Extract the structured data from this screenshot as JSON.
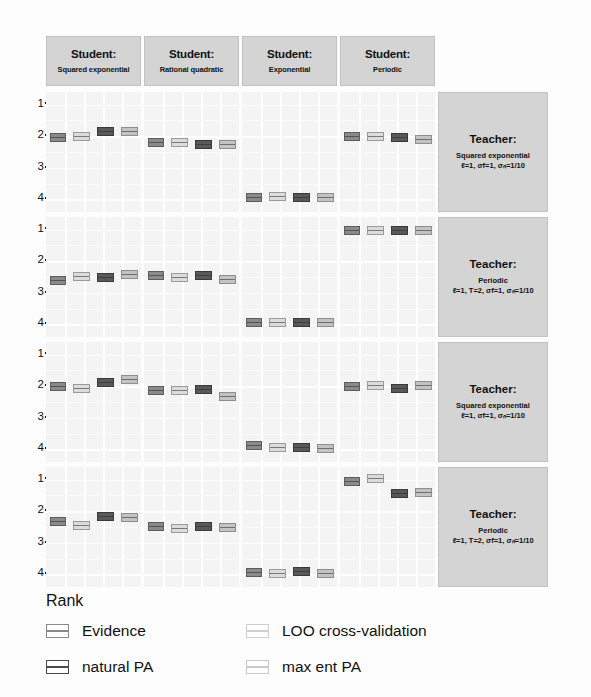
{
  "axis": {
    "ylabel": "Rank",
    "yticks": [
      "1",
      "2",
      "3",
      "4"
    ]
  },
  "columns": [
    {
      "title": "Student:",
      "subtitle": "Squared exponential"
    },
    {
      "title": "Student:",
      "subtitle": "Rational quadratic"
    },
    {
      "title": "Student:",
      "subtitle": "Exponential"
    },
    {
      "title": "Student:",
      "subtitle": "Periodic"
    }
  ],
  "rows": [
    {
      "title": "Teacher:",
      "subtitle": "Squared exponential",
      "params": "ℓ=1, σf=1, σₙ=1/10"
    },
    {
      "title": "Teacher:",
      "subtitle": "Periodic",
      "params": "ℓ=1, T=2, σf=1, σₙ=1/10"
    },
    {
      "title": "Teacher:",
      "subtitle": "Squared exponential",
      "params": "ℓ=1, σf=1, σₙ=1/10"
    },
    {
      "title": "Teacher:",
      "subtitle": "Periodic",
      "params": "ℓ=1, T=2, σf=1, σₙ=1/10"
    }
  ],
  "legend": [
    {
      "key": "evidence",
      "label": "Evidence"
    },
    {
      "key": "loo",
      "label": "LOO cross-validation"
    },
    {
      "key": "natural",
      "label": "natural PA"
    },
    {
      "key": "maxent",
      "label": "max ent PA"
    }
  ],
  "chart_data": {
    "type": "box",
    "title": "",
    "xlabel": "",
    "ylabel": "Rank",
    "ylim": [
      0.6,
      4.4
    ],
    "yticks": [
      1,
      2,
      3,
      4
    ],
    "grid": true,
    "legend_position": "bottom-left",
    "legend_entries": [
      "Evidence",
      "LOO cross-validation",
      "natural PA",
      "max ent PA"
    ],
    "facet_columns": [
      "Squared exponential",
      "Rational quadratic",
      "Exponential",
      "Periodic"
    ],
    "facet_rows": [
      "Squared exponential",
      "Periodic",
      "Squared exponential",
      "Periodic"
    ],
    "methods": [
      "Evidence",
      "LOO cross-validation",
      "natural PA",
      "max ent PA"
    ],
    "panels": [
      {
        "row": 0,
        "col": 0,
        "teacher": "Squared exponential",
        "student": "Squared exponential",
        "boxes": [
          {
            "method": "Evidence",
            "median": 2.05,
            "q1": 1.95,
            "q3": 2.15
          },
          {
            "method": "LOO cross-validation",
            "median": 2.0,
            "q1": 1.9,
            "q3": 2.1
          },
          {
            "method": "natural PA",
            "median": 1.85,
            "q1": 1.75,
            "q3": 1.95
          },
          {
            "method": "max ent PA",
            "median": 1.85,
            "q1": 1.75,
            "q3": 1.95
          }
        ]
      },
      {
        "row": 0,
        "col": 1,
        "teacher": "Squared exponential",
        "student": "Rational quadratic",
        "boxes": [
          {
            "method": "Evidence",
            "median": 2.2,
            "q1": 2.1,
            "q3": 2.3
          },
          {
            "method": "LOO cross-validation",
            "median": 2.2,
            "q1": 2.1,
            "q3": 2.3
          },
          {
            "method": "natural PA",
            "median": 2.25,
            "q1": 2.15,
            "q3": 2.35
          },
          {
            "method": "max ent PA",
            "median": 2.25,
            "q1": 2.15,
            "q3": 2.35
          }
        ]
      },
      {
        "row": 0,
        "col": 2,
        "teacher": "Squared exponential",
        "student": "Exponential",
        "boxes": [
          {
            "method": "Evidence",
            "median": 3.95,
            "q1": 3.88,
            "q3": 4.0
          },
          {
            "method": "LOO cross-validation",
            "median": 3.9,
            "q1": 3.82,
            "q3": 3.98
          },
          {
            "method": "natural PA",
            "median": 3.95,
            "q1": 3.88,
            "q3": 4.0
          },
          {
            "method": "max ent PA",
            "median": 3.95,
            "q1": 3.88,
            "q3": 4.0
          }
        ]
      },
      {
        "row": 0,
        "col": 3,
        "teacher": "Squared exponential",
        "student": "Periodic",
        "boxes": [
          {
            "method": "Evidence",
            "median": 2.0,
            "q1": 1.9,
            "q3": 2.1
          },
          {
            "method": "LOO cross-validation",
            "median": 2.0,
            "q1": 1.9,
            "q3": 2.1
          },
          {
            "method": "natural PA",
            "median": 2.05,
            "q1": 1.95,
            "q3": 2.15
          },
          {
            "method": "max ent PA",
            "median": 2.1,
            "q1": 2.0,
            "q3": 2.2
          }
        ]
      },
      {
        "row": 1,
        "col": 0,
        "teacher": "Periodic",
        "student": "Squared exponential",
        "boxes": [
          {
            "method": "Evidence",
            "median": 2.62,
            "q1": 2.52,
            "q3": 2.72
          },
          {
            "method": "LOO cross-validation",
            "median": 2.48,
            "q1": 2.38,
            "q3": 2.58
          },
          {
            "method": "natural PA",
            "median": 2.52,
            "q1": 2.42,
            "q3": 2.62
          },
          {
            "method": "max ent PA",
            "median": 2.42,
            "q1": 2.32,
            "q3": 2.52
          }
        ]
      },
      {
        "row": 1,
        "col": 1,
        "teacher": "Periodic",
        "student": "Rational quadratic",
        "boxes": [
          {
            "method": "Evidence",
            "median": 2.45,
            "q1": 2.35,
            "q3": 2.55
          },
          {
            "method": "LOO cross-validation",
            "median": 2.52,
            "q1": 2.42,
            "q3": 2.62
          },
          {
            "method": "natural PA",
            "median": 2.45,
            "q1": 2.35,
            "q3": 2.55
          },
          {
            "method": "max ent PA",
            "median": 2.58,
            "q1": 2.48,
            "q3": 2.68
          }
        ]
      },
      {
        "row": 1,
        "col": 2,
        "teacher": "Periodic",
        "student": "Exponential",
        "boxes": [
          {
            "method": "Evidence",
            "median": 3.95,
            "q1": 3.88,
            "q3": 4.0
          },
          {
            "method": "LOO cross-validation",
            "median": 3.95,
            "q1": 3.88,
            "q3": 4.0
          },
          {
            "method": "natural PA",
            "median": 3.95,
            "q1": 3.88,
            "q3": 4.0
          },
          {
            "method": "max ent PA",
            "median": 3.95,
            "q1": 3.88,
            "q3": 4.0
          }
        ]
      },
      {
        "row": 1,
        "col": 3,
        "teacher": "Periodic",
        "student": "Periodic",
        "boxes": [
          {
            "method": "Evidence",
            "median": 1.02,
            "q1": 1.0,
            "q3": 1.08
          },
          {
            "method": "LOO cross-validation",
            "median": 1.02,
            "q1": 1.0,
            "q3": 1.08
          },
          {
            "method": "natural PA",
            "median": 1.02,
            "q1": 1.0,
            "q3": 1.08
          },
          {
            "method": "max ent PA",
            "median": 1.02,
            "q1": 1.0,
            "q3": 1.08
          }
        ]
      },
      {
        "row": 2,
        "col": 0,
        "teacher": "Squared exponential",
        "student": "Squared exponential",
        "boxes": [
          {
            "method": "Evidence",
            "median": 2.02,
            "q1": 1.92,
            "q3": 2.12
          },
          {
            "method": "LOO cross-validation",
            "median": 2.08,
            "q1": 1.98,
            "q3": 2.18
          },
          {
            "method": "natural PA",
            "median": 1.88,
            "q1": 1.78,
            "q3": 1.98
          },
          {
            "method": "max ent PA",
            "median": 1.8,
            "q1": 1.7,
            "q3": 1.9
          }
        ]
      },
      {
        "row": 2,
        "col": 1,
        "teacher": "Squared exponential",
        "student": "Rational quadratic",
        "boxes": [
          {
            "method": "Evidence",
            "median": 2.12,
            "q1": 2.02,
            "q3": 2.22
          },
          {
            "method": "LOO cross-validation",
            "median": 2.12,
            "q1": 2.02,
            "q3": 2.22
          },
          {
            "method": "natural PA",
            "median": 2.1,
            "q1": 2.0,
            "q3": 2.2
          },
          {
            "method": "max ent PA",
            "median": 2.32,
            "q1": 2.22,
            "q3": 2.42
          }
        ]
      },
      {
        "row": 2,
        "col": 2,
        "teacher": "Squared exponential",
        "student": "Exponential",
        "boxes": [
          {
            "method": "Evidence",
            "median": 3.88,
            "q1": 3.8,
            "q3": 3.96
          },
          {
            "method": "LOO cross-validation",
            "median": 3.95,
            "q1": 3.88,
            "q3": 4.0
          },
          {
            "method": "natural PA",
            "median": 3.95,
            "q1": 3.88,
            "q3": 4.0
          },
          {
            "method": "max ent PA",
            "median": 3.98,
            "q1": 3.92,
            "q3": 4.02
          }
        ]
      },
      {
        "row": 2,
        "col": 3,
        "teacher": "Squared exponential",
        "student": "Periodic",
        "boxes": [
          {
            "method": "Evidence",
            "median": 2.02,
            "q1": 1.92,
            "q3": 2.12
          },
          {
            "method": "LOO cross-validation",
            "median": 1.98,
            "q1": 1.88,
            "q3": 2.08
          },
          {
            "method": "natural PA",
            "median": 2.08,
            "q1": 1.98,
            "q3": 2.18
          },
          {
            "method": "max ent PA",
            "median": 1.98,
            "q1": 1.88,
            "q3": 2.08
          }
        ]
      },
      {
        "row": 3,
        "col": 0,
        "teacher": "Periodic",
        "student": "Squared exponential",
        "boxes": [
          {
            "method": "Evidence",
            "median": 2.32,
            "q1": 2.22,
            "q3": 2.42
          },
          {
            "method": "LOO cross-validation",
            "median": 2.45,
            "q1": 2.35,
            "q3": 2.55
          },
          {
            "method": "natural PA",
            "median": 2.18,
            "q1": 2.08,
            "q3": 2.28
          },
          {
            "method": "max ent PA",
            "median": 2.2,
            "q1": 2.1,
            "q3": 2.3
          }
        ]
      },
      {
        "row": 3,
        "col": 1,
        "teacher": "Periodic",
        "student": "Rational quadratic",
        "boxes": [
          {
            "method": "Evidence",
            "median": 2.48,
            "q1": 2.38,
            "q3": 2.58
          },
          {
            "method": "LOO cross-validation",
            "median": 2.55,
            "q1": 2.45,
            "q3": 2.65
          },
          {
            "method": "natural PA",
            "median": 2.48,
            "q1": 2.38,
            "q3": 2.58
          },
          {
            "method": "max ent PA",
            "median": 2.52,
            "q1": 2.42,
            "q3": 2.62
          }
        ]
      },
      {
        "row": 3,
        "col": 2,
        "teacher": "Periodic",
        "student": "Exponential",
        "boxes": [
          {
            "method": "Evidence",
            "median": 3.95,
            "q1": 3.88,
            "q3": 4.0
          },
          {
            "method": "LOO cross-validation",
            "median": 3.98,
            "q1": 3.92,
            "q3": 4.02
          },
          {
            "method": "natural PA",
            "median": 3.92,
            "q1": 3.85,
            "q3": 3.99
          },
          {
            "method": "max ent PA",
            "median": 3.98,
            "q1": 3.92,
            "q3": 4.02
          }
        ]
      },
      {
        "row": 3,
        "col": 3,
        "teacher": "Periodic",
        "student": "Periodic",
        "boxes": [
          {
            "method": "Evidence",
            "median": 1.05,
            "q1": 1.0,
            "q3": 1.12
          },
          {
            "method": "LOO cross-validation",
            "median": 0.95,
            "q1": 0.9,
            "q3": 1.02
          },
          {
            "method": "natural PA",
            "median": 1.45,
            "q1": 1.35,
            "q3": 1.55
          },
          {
            "method": "max ent PA",
            "median": 1.42,
            "q1": 1.32,
            "q3": 1.52
          }
        ]
      }
    ]
  }
}
